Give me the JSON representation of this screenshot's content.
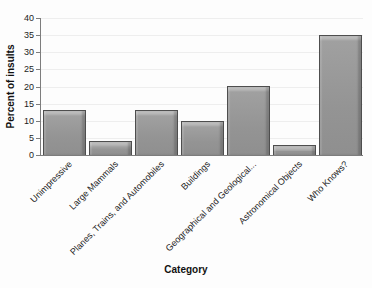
{
  "chart_data": {
    "type": "bar",
    "categories": [
      "Unimpressive",
      "Large Mammals",
      "Planes, Trains, and Automobiles",
      "Buildings",
      "Geographical and Geological...",
      "Astronomical Objects",
      "Who Knows?"
    ],
    "values": [
      13,
      4,
      13,
      10,
      20,
      3,
      35
    ],
    "title": "",
    "xlabel": "Category",
    "ylabel": "Percent of insults",
    "ylim": [
      0,
      40
    ],
    "ytick_step": 5,
    "grid": "horizontal-faint",
    "legend": "none",
    "bar_color": "#949494",
    "bar_border_color": "#4e4e4e",
    "axis_color": "#7d7d7d"
  }
}
